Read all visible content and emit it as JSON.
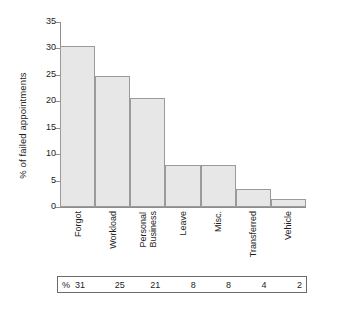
{
  "chart_data": {
    "type": "bar",
    "title": "",
    "xlabel": "",
    "ylabel": "% of failed appointments",
    "ylim": [
      0,
      35
    ],
    "grid": false,
    "legend": "none",
    "yticks": [
      0,
      5,
      10,
      15,
      20,
      25,
      30,
      35
    ],
    "ytick_labels": [
      "0",
      "5",
      "10",
      "15",
      "20",
      "25",
      "30",
      "35"
    ],
    "categories": [
      "Forgot",
      "Workload",
      "Personal Business",
      "Leave",
      "Misc.",
      "Transferred",
      "Vehicle"
    ],
    "category_lines": [
      [
        "Forgot"
      ],
      [
        "Workload"
      ],
      [
        "Personal",
        "Business"
      ],
      [
        "Leave"
      ],
      [
        "Misc."
      ],
      [
        "Transferred"
      ],
      [
        "Vehicle"
      ]
    ],
    "values": [
      30.5,
      24.7,
      20.7,
      8.0,
      8.0,
      3.5,
      1.6
    ],
    "bar_fill": "#e7e7e7",
    "bar_edge": "#9a9a9a",
    "axis_color": "#8e8e8e"
  },
  "table": {
    "percent_symbol": "%",
    "values": [
      "31",
      "25",
      "21",
      "8",
      "8",
      "4",
      "2"
    ]
  }
}
